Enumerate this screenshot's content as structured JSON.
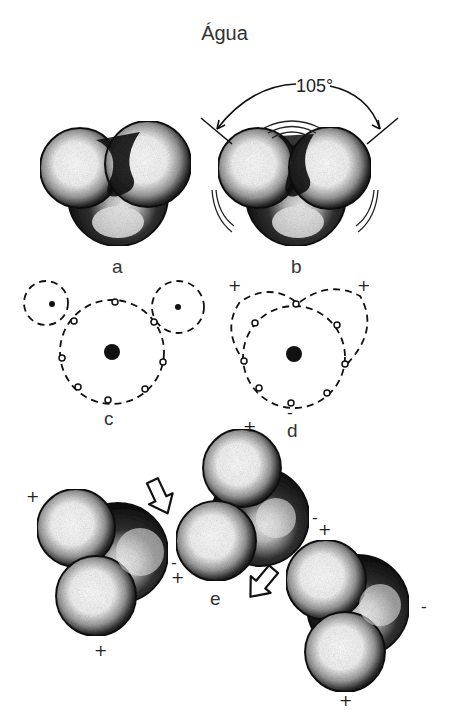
{
  "title": "Água",
  "angle_label": "105°",
  "panels": {
    "a": {
      "label": "a",
      "description": "space-filling water molecule model"
    },
    "b": {
      "label": "b",
      "description": "space-filling model with 105° bond angle"
    },
    "c": {
      "label": "c",
      "description": "electron orbit diagram: oxygen with two hydrogens"
    },
    "d": {
      "label": "d",
      "description": "overlapping orbits showing polarity",
      "signs": [
        "+",
        "+",
        "-"
      ]
    },
    "e": {
      "label": "e",
      "description": "hydrogen bonding between three water molecules",
      "signs": [
        "+",
        "+",
        "-",
        "+",
        "+",
        "-",
        "-",
        "+",
        "-",
        "+"
      ]
    }
  },
  "colors": {
    "ink": "#111111",
    "background": "#ffffff",
    "text": "#333333"
  }
}
